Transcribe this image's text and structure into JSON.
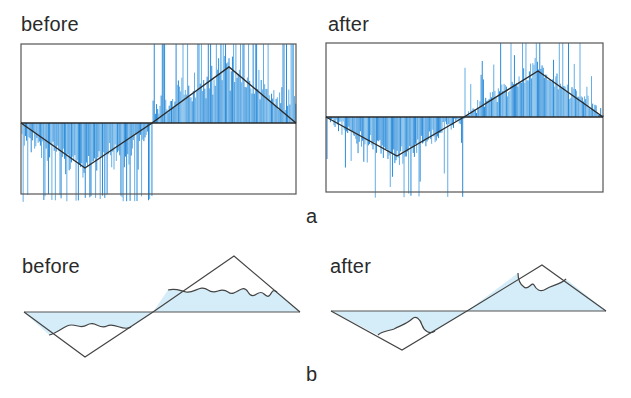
{
  "figure": {
    "panel_a": {
      "label": "a",
      "before": {
        "title": "before",
        "frame": {
          "x": 21,
          "y": 44,
          "w": 275,
          "h": 150
        },
        "center_y": 123,
        "wave": [
          [
            21,
            123
          ],
          [
            85,
            168
          ],
          [
            152,
            123
          ],
          [
            229,
            67
          ],
          [
            296,
            123
          ]
        ],
        "noise": {
          "seed": 7,
          "amplitude": "high",
          "spike_overflow": 8
        }
      },
      "after": {
        "title": "after",
        "frame": {
          "x": 326,
          "y": 43,
          "w": 277,
          "h": 149
        },
        "center_y": 117,
        "wave": [
          [
            326,
            117
          ],
          [
            397,
            156
          ],
          [
            464,
            117
          ],
          [
            538,
            71
          ],
          [
            603,
            117
          ]
        ],
        "noise": {
          "seed": 19,
          "amplitude": "low",
          "spike_overflow": 6
        }
      }
    },
    "panel_b": {
      "label": "b",
      "before": {
        "title": "before",
        "axis_y": 312,
        "triangle": [
          [
            24,
            312
          ],
          [
            85,
            357
          ],
          [
            153,
            312
          ],
          [
            234,
            256
          ],
          [
            300,
            312
          ]
        ]
      },
      "after": {
        "title": "after",
        "axis_y": 311,
        "triangle": [
          [
            331,
            311
          ],
          [
            402,
            350
          ],
          [
            467,
            311
          ],
          [
            542,
            265
          ],
          [
            606,
            311
          ]
        ]
      }
    },
    "colors": {
      "bars": "#2b8bd9",
      "bars_light": "#63aee6",
      "fill": "#d5edf8",
      "line": "#2a2a2a",
      "frame": "#555555"
    }
  }
}
